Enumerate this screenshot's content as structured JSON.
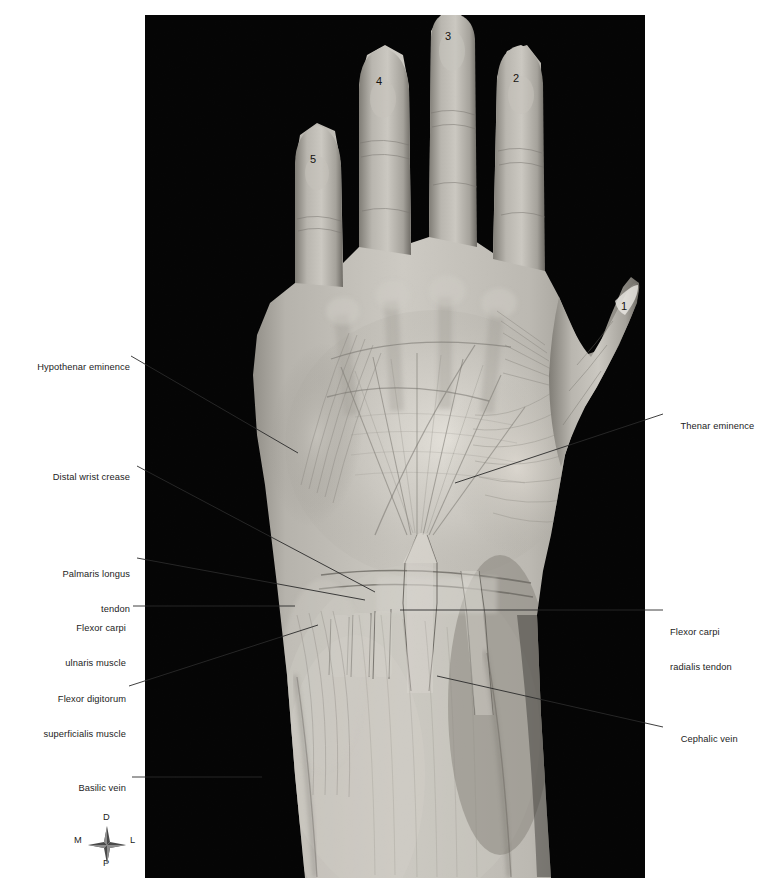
{
  "figure": {
    "background_color": "#ffffff",
    "panel_color": "#050505"
  },
  "labels_left": [
    {
      "id": "hypothenar-eminence",
      "text": "Hypothenar eminence"
    },
    {
      "id": "distal-wrist-crease",
      "text": "Distal wrist crease"
    },
    {
      "id": "palmaris-longus-tendon",
      "line1": "Palmaris longus",
      "line2": "tendon"
    },
    {
      "id": "flexor-carpi-ulnaris-muscle",
      "line1": "Flexor carpi",
      "line2": "ulnaris muscle"
    },
    {
      "id": "flexor-digitorum-superficialis-muscle",
      "line1": "Flexor digitorum",
      "line2": "superficialis muscle"
    },
    {
      "id": "basilic-vein",
      "text": "Basilic vein"
    }
  ],
  "labels_right": [
    {
      "id": "thenar-eminence",
      "text": "Thenar eminence"
    },
    {
      "id": "flexor-carpi-radialis-tendon",
      "line1": "Flexor carpi",
      "line2": "radialis tendon"
    },
    {
      "id": "cephalic-vein",
      "text": "Cephalic vein"
    }
  ],
  "digit_numbers": [
    {
      "id": "digit-1-thumb",
      "text": "1"
    },
    {
      "id": "digit-2-index",
      "text": "2"
    },
    {
      "id": "digit-3-middle",
      "text": "3"
    },
    {
      "id": "digit-4-ring",
      "text": "4"
    },
    {
      "id": "digit-5-little",
      "text": "5"
    }
  ],
  "compass": {
    "distal": "D",
    "medial": "M",
    "lateral": "L",
    "proximal": "P"
  },
  "colors": {
    "label_text": "#1c1c1c",
    "leader_line": "#2a2a2a",
    "panel": "#050505",
    "page": "#ffffff",
    "skin_light": "#d8d6d0",
    "skin_mid": "#a8a59d",
    "skin_dark": "#6e6b64"
  }
}
